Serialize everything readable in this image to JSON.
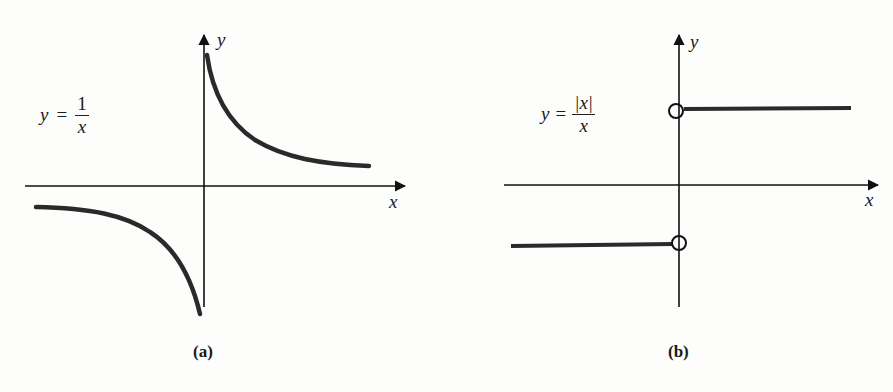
{
  "figure": {
    "panels": [
      {
        "id": "a",
        "caption": "(a)",
        "equation": {
          "lhs": "y",
          "eq": "=",
          "numerator": "1",
          "denominator": "x"
        },
        "x_axis_label": "x",
        "y_axis_label": "y",
        "description": "Hyperbola y = 1/x, two branches in quadrants I and III"
      },
      {
        "id": "b",
        "caption": "(b)",
        "equation": {
          "lhs": "y",
          "eq": "=",
          "numerator": "|x|",
          "denominator": "x"
        },
        "x_axis_label": "x",
        "y_axis_label": "y",
        "description": "Step function y = |x|/x: y = 1 for x > 0, y = -1 for x < 0, open circles at x = 0"
      }
    ],
    "colors": {
      "curve": "#2a2a2a",
      "axis": "#111111",
      "background": "#fdfdfc"
    }
  }
}
